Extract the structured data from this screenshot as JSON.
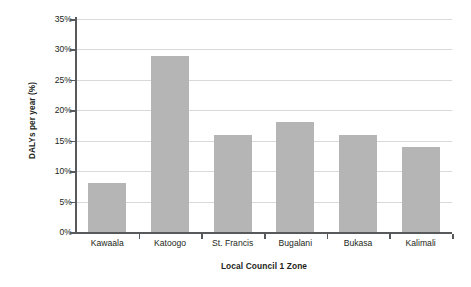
{
  "chart_data": {
    "type": "bar",
    "title": "",
    "xlabel": "Local Council 1 Zone",
    "ylabel": "DALYs per year (%)",
    "categories": [
      "Kawaala",
      "Katoogo",
      "St. Francis",
      "Bugalani",
      "Bukasa",
      "Kalimali"
    ],
    "values": [
      8,
      29,
      16,
      18,
      16,
      14
    ],
    "ylim": [
      0,
      35
    ],
    "ytick_values": [
      0,
      5,
      10,
      15,
      20,
      25,
      30,
      35
    ],
    "ytick_labels": [
      "0%",
      "5%",
      "10%",
      "15%",
      "20%",
      "25%",
      "30%",
      "35%"
    ],
    "grid": true,
    "legend": "none",
    "series": [
      {
        "name": "DALYs per year (%)",
        "color": "#b5b5b5",
        "values": [
          8,
          29,
          16,
          18,
          16,
          14
        ]
      }
    ],
    "colors": {
      "bar_fill": "#b5b5b5",
      "gridline": "#d9d9d9",
      "axis_line": "#58595b",
      "text": "#231f20",
      "background": "#ffffff"
    }
  }
}
